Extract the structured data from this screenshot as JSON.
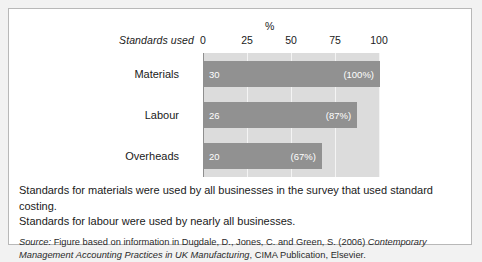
{
  "figure": {
    "axis_unit": "%",
    "y_axis_title": "Standards used",
    "caption_line_1": "Standards for materials were used by all businesses in the survey that used standard costing.",
    "caption_line_2": "Standards for labour were used by nearly all businesses.",
    "source_label": "Source:",
    "source_text_1": " Figure based on information in Dugdale, D., Jones, C. and Green, S. (2006) ",
    "source_title_1": "Contemporary Management",
    "source_title_2": "Accounting Practices in UK Manufacturing",
    "source_text_2": ", CIMA Publication, Elsevier."
  },
  "colors": {
    "bar_fill": "#919191",
    "plot_background": "#dcdcdc",
    "gridline": "#f4f4f4",
    "card_border": "#b8b8b8",
    "page_background": "#f2f2f2"
  },
  "chart_data": {
    "type": "bar",
    "orientation": "horizontal",
    "title": "",
    "xlabel": "%",
    "ylabel": "Standards used",
    "xlim": [
      0,
      100
    ],
    "ticks": [
      "0",
      "25",
      "50",
      "75",
      "100"
    ],
    "tick_values": [
      0,
      25,
      50,
      75,
      100
    ],
    "grid": true,
    "legend": "none",
    "categories": [
      "Materials",
      "Labour",
      "Overheads"
    ],
    "values": [
      100,
      87,
      67
    ],
    "counts": [
      30,
      26,
      20
    ],
    "bar_labels_left": [
      "30",
      "26",
      "20"
    ],
    "bar_labels_right": [
      "(100%)",
      "(87%)",
      "(67%)"
    ]
  }
}
